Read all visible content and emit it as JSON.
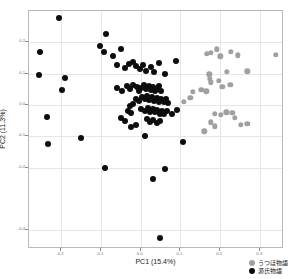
{
  "chart_data": {
    "type": "scatter",
    "title": "",
    "xlabel": "PC1 (15.4%)",
    "ylabel": "PC2 (11.3%)",
    "xlim": [
      -0.28,
      0.36
    ],
    "ylim": [
      -0.46,
      0.3
    ],
    "xticks": [
      -0.2,
      -0.1,
      0.0,
      0.1,
      0.2,
      0.3
    ],
    "xtick_labels": [
      "-0.2",
      "-0.1",
      "0.0",
      "0.1",
      "0.2",
      "0.3"
    ],
    "yticks": [
      -0.4,
      -0.2,
      -0.1,
      0.0,
      0.1,
      0.2
    ],
    "ytick_labels": [
      "-0.4",
      "-0.2",
      "-0.1",
      "0.0",
      "0.1",
      "0.2"
    ],
    "grid": true,
    "legend_position": "lower-right",
    "colors": {
      "utsuho": "#a0a0a0",
      "genji": "#0d0d0d",
      "grid": "#e6e6e6",
      "frame": "#b9b9b9",
      "axis_text": "#6e6e6e",
      "label_text": "#1a1a1a",
      "background": "#ffffff"
    },
    "series": [
      {
        "name": "うつほ物語",
        "color": "#a0a0a0",
        "marker": "circle",
        "marker_size": 5.4,
        "points": [
          [
            0.167,
            0.163
          ],
          [
            0.176,
            0.166
          ],
          [
            0.192,
            0.178
          ],
          [
            0.2,
            0.155
          ],
          [
            0.226,
            0.17
          ],
          [
            0.244,
            0.158
          ],
          [
            0.34,
            0.16
          ],
          [
            0.173,
            0.098
          ],
          [
            0.174,
            0.083
          ],
          [
            0.177,
            0.072
          ],
          [
            0.196,
            0.077
          ],
          [
            0.216,
            0.105
          ],
          [
            0.268,
            0.108
          ],
          [
            0.205,
            0.058
          ],
          [
            0.225,
            0.064
          ],
          [
            0.131,
            0.042
          ],
          [
            0.152,
            0.049
          ],
          [
            0.165,
            0.044
          ],
          [
            0.108,
            0.01
          ],
          [
            0.125,
            0.022
          ],
          [
            0.186,
            -0.029
          ],
          [
            0.202,
            -0.032
          ],
          [
            0.215,
            -0.024
          ],
          [
            0.23,
            -0.026
          ],
          [
            0.236,
            -0.041
          ],
          [
            0.177,
            -0.055
          ],
          [
            0.186,
            -0.068
          ],
          [
            0.252,
            -0.063
          ],
          [
            0.268,
            -0.061
          ],
          [
            0.16,
            -0.084
          ]
        ]
      },
      {
        "name": "源氏物語",
        "color": "#0d0d0d",
        "marker": "circle",
        "marker_size": 6.0,
        "points": [
          [
            -0.205,
            0.278
          ],
          [
            -0.252,
            0.168
          ],
          [
            -0.254,
            0.095
          ],
          [
            -0.235,
            -0.038
          ],
          [
            -0.19,
            0.086
          ],
          [
            -0.196,
            0.048
          ],
          [
            -0.088,
            0.225
          ],
          [
            -0.102,
            0.188
          ],
          [
            -0.092,
            0.17
          ],
          [
            -0.07,
            0.155
          ],
          [
            -0.048,
            0.18
          ],
          [
            -0.06,
            0.128
          ],
          [
            -0.038,
            0.118
          ],
          [
            -0.03,
            0.132
          ],
          [
            -0.019,
            0.138
          ],
          [
            -0.012,
            0.124
          ],
          [
            -0.002,
            0.115
          ],
          [
            0.006,
            0.126
          ],
          [
            0.014,
            0.11
          ],
          [
            0.026,
            0.12
          ],
          [
            0.034,
            0.104
          ],
          [
            0.047,
            0.134
          ],
          [
            0.062,
            0.099
          ],
          [
            0.088,
            0.14
          ],
          [
            -0.058,
            0.055
          ],
          [
            -0.046,
            0.044
          ],
          [
            -0.034,
            0.06
          ],
          [
            -0.026,
            0.052
          ],
          [
            -0.018,
            0.064
          ],
          [
            -0.01,
            0.058
          ],
          [
            -0.004,
            0.046
          ],
          [
            0.002,
            0.055
          ],
          [
            0.008,
            0.063
          ],
          [
            0.014,
            0.05
          ],
          [
            0.02,
            0.059
          ],
          [
            0.026,
            0.047
          ],
          [
            0.03,
            0.056
          ],
          [
            0.036,
            0.043
          ],
          [
            0.04,
            0.052
          ],
          [
            0.046,
            0.06
          ],
          [
            0.052,
            0.046
          ],
          [
            -0.012,
            0.02
          ],
          [
            -0.004,
            0.014
          ],
          [
            0.004,
            0.026
          ],
          [
            0.01,
            0.018
          ],
          [
            0.016,
            0.028
          ],
          [
            0.022,
            0.016
          ],
          [
            0.028,
            0.024
          ],
          [
            0.034,
            0.012
          ],
          [
            0.04,
            0.022
          ],
          [
            0.046,
            0.01
          ],
          [
            0.052,
            0.02
          ],
          [
            0.058,
            0.008
          ],
          [
            0.064,
            0.018
          ],
          [
            0.07,
            0.006
          ],
          [
            -0.026,
            -0.004
          ],
          [
            -0.018,
            0.002
          ],
          [
            -0.032,
            -0.018
          ],
          [
            -0.024,
            -0.026
          ],
          [
            0.002,
            -0.012
          ],
          [
            0.01,
            -0.02
          ],
          [
            0.018,
            -0.01
          ],
          [
            0.024,
            -0.022
          ],
          [
            0.03,
            -0.014
          ],
          [
            0.036,
            -0.024
          ],
          [
            0.042,
            -0.016
          ],
          [
            0.048,
            -0.028
          ],
          [
            0.054,
            -0.018
          ],
          [
            0.06,
            -0.03
          ],
          [
            0.066,
            -0.02
          ],
          [
            0.08,
            -0.028
          ],
          [
            0.092,
            -0.016
          ],
          [
            -0.05,
            -0.042
          ],
          [
            -0.04,
            -0.052
          ],
          [
            0.016,
            -0.046
          ],
          [
            0.024,
            -0.056
          ],
          [
            0.032,
            -0.048
          ],
          [
            0.04,
            -0.058
          ],
          [
            0.048,
            -0.05
          ],
          [
            -0.024,
            -0.07
          ],
          [
            -0.012,
            -0.064
          ],
          [
            -0.232,
            -0.124
          ],
          [
            -0.15,
            -0.104
          ],
          [
            0.012,
            -0.1
          ],
          [
            0.106,
            -0.118
          ],
          [
            -0.09,
            -0.2
          ],
          [
            0.062,
            -0.205
          ],
          [
            0.03,
            -0.238
          ],
          [
            0.05,
            -0.425
          ]
        ]
      }
    ]
  },
  "legend": {
    "entries": [
      {
        "label": "うつほ物語",
        "color": "#a0a0a0"
      },
      {
        "label": "源氏物語",
        "color": "#0d0d0d"
      }
    ]
  }
}
